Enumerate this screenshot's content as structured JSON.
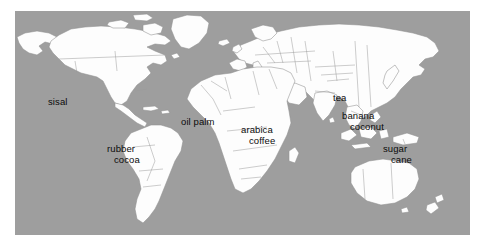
{
  "figure": {
    "kind": "world-map",
    "title": "",
    "background_color": "#ffffff",
    "ocean_color": "#9e9e9e",
    "land_color": "#fdfdfd",
    "border_color": "#8f8f8f",
    "label_color": "#0b0b0b",
    "frame": {
      "left": 15,
      "top": 11,
      "width": 455,
      "height": 224
    }
  },
  "map": {
    "projection": "equirectangular",
    "labels": [
      {
        "id": "sisal",
        "text": "sisal",
        "x": 48,
        "y": 96,
        "region": "Mexico / Central America"
      },
      {
        "id": "rubber",
        "text": "rubber",
        "x": 107,
        "y": 143,
        "region": "northern South America"
      },
      {
        "id": "cocoa",
        "text": "cocoa",
        "x": 114,
        "y": 154,
        "region": "northern South America"
      },
      {
        "id": "oil-palm",
        "text": "oil palm",
        "x": 181,
        "y": 116,
        "region": "West Africa"
      },
      {
        "id": "arabica",
        "text": "arabica",
        "x": 241,
        "y": 124,
        "region": "East Africa / Ethiopia"
      },
      {
        "id": "coffee",
        "text": "coffee",
        "x": 249,
        "y": 135,
        "region": "East Africa / Ethiopia"
      },
      {
        "id": "tea",
        "text": "tea",
        "x": 333,
        "y": 92,
        "region": "southern China"
      },
      {
        "id": "banana",
        "text": "banana",
        "x": 342,
        "y": 110,
        "region": "Southeast Asia"
      },
      {
        "id": "coconut",
        "text": "coconut",
        "x": 350,
        "y": 121,
        "region": "Southeast Asia"
      },
      {
        "id": "sugar",
        "text": "sugar",
        "x": 383,
        "y": 143,
        "region": "New Guinea / Pacific"
      },
      {
        "id": "cane",
        "text": "cane",
        "x": 391,
        "y": 154,
        "region": "New Guinea / Pacific"
      }
    ]
  }
}
